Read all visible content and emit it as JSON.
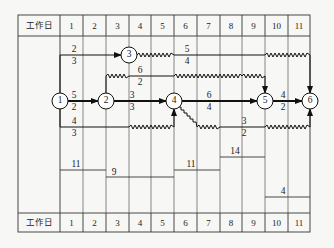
{
  "header": {
    "row_label": "工作日",
    "days": [
      "1",
      "2",
      "3",
      "4",
      "5",
      "6",
      "7",
      "8",
      "9",
      "10",
      "11"
    ]
  },
  "footer": {
    "row_label": "工作日",
    "days": [
      "1",
      "2",
      "3",
      "4",
      "5",
      "6",
      "7",
      "8",
      "9",
      "10",
      "11"
    ]
  },
  "nodes": [
    {
      "id": "1",
      "label": "1"
    },
    {
      "id": "2",
      "label": "2"
    },
    {
      "id": "3",
      "label": "3"
    },
    {
      "id": "4",
      "label": "4"
    },
    {
      "id": "5",
      "label": "5"
    },
    {
      "id": "6",
      "label": "6"
    }
  ],
  "activities": [
    {
      "from": "1",
      "to": "3",
      "duration_label_top": "2",
      "resource_label_bottom": "3"
    },
    {
      "from": "1",
      "to": "2",
      "duration_label_top": "5",
      "resource_label_bottom": "2"
    },
    {
      "from": "1",
      "to": "4",
      "duration_label_top": "4",
      "resource_label_bottom": "3"
    },
    {
      "from": "2",
      "to": "4",
      "duration_label_top": "3",
      "resource_label_bottom": "3"
    },
    {
      "from": "2",
      "to": "5",
      "duration_label_top": "6",
      "resource_label_bottom": "2"
    },
    {
      "from": "3",
      "to": "6",
      "duration_label_top": "5",
      "resource_label_bottom": "4"
    },
    {
      "from": "4",
      "to": "5",
      "duration_label_top": "6",
      "resource_label_bottom": "4"
    },
    {
      "from": "4",
      "to": "6",
      "duration_label_top": "3",
      "resource_label_bottom": "2"
    },
    {
      "from": "5",
      "to": "6",
      "duration_label_top": "4",
      "resource_label_bottom": "2"
    }
  ],
  "resource_histogram": {
    "labels": [
      "11",
      "9",
      "11",
      "14",
      "4"
    ],
    "segments": [
      {
        "days": "1-2",
        "value": "11"
      },
      {
        "days": "3-5",
        "value": "9"
      },
      {
        "days": "6-7",
        "value": "11"
      },
      {
        "days": "8-9",
        "value": "14"
      },
      {
        "days": "10-11",
        "value": "4"
      }
    ]
  }
}
